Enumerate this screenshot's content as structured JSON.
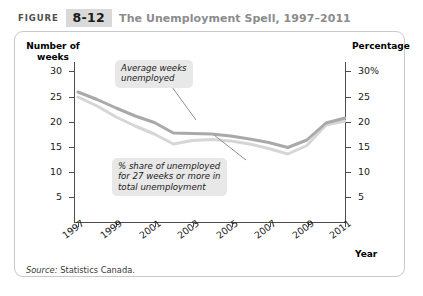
{
  "header": {
    "figure_word": "FIGURE",
    "figure_number": "8-12",
    "title": "The Unemployment Spell, 1997–2011"
  },
  "source": {
    "label": "Source:",
    "text": "Statistics Canada."
  },
  "colors": {
    "line_dark": "#a9a9a9",
    "line_light": "#d6d6d6",
    "axis": "#4d4d4d",
    "callout_bg": "#e8e8e8",
    "badge_bg": "#d9d9d9",
    "title_text": "#8c8c8c",
    "frame_border": "#c9c9c9"
  },
  "chart_data": {
    "type": "line",
    "title": "The Unemployment Spell, 1997–2011",
    "xlabel": "Year",
    "ylabel": "Number of weeks",
    "y2label": "Percentage",
    "xlim": [
      1997,
      2011
    ],
    "ylim": [
      0,
      32
    ],
    "y2lim": [
      0,
      32
    ],
    "grid": false,
    "legend": "annotations",
    "y_ticks": [
      5,
      10,
      15,
      20,
      25,
      30
    ],
    "y_tick_labels": [
      "5",
      "10",
      "15",
      "20",
      "25",
      "30"
    ],
    "y2_ticks": [
      5,
      10,
      15,
      20,
      25,
      30
    ],
    "y2_tick_labels": [
      "5",
      "10",
      "15",
      "20",
      "25",
      "30%"
    ],
    "x_ticks": [
      1997,
      1999,
      2001,
      2003,
      2005,
      2007,
      2009,
      2011
    ],
    "x_tick_labels": [
      "1997",
      "1999",
      "2001",
      "2003",
      "2005",
      "2007",
      "2009",
      "2011"
    ],
    "x": [
      1997,
      1998,
      1999,
      2000,
      2001,
      2002,
      2003,
      2004,
      2005,
      2006,
      2007,
      2008,
      2009,
      2010,
      2011
    ],
    "series": [
      {
        "name": "Average weeks unemployed",
        "axis": "left",
        "color": "#a9a9a9",
        "values": [
          26.0,
          24.5,
          22.8,
          21.2,
          19.9,
          17.8,
          17.7,
          17.6,
          17.2,
          16.6,
          15.9,
          14.9,
          16.4,
          19.8,
          20.8
        ]
      },
      {
        "name": "% share of unemployed for 27 weeks or more in total unemployment",
        "axis": "right",
        "color": "#d6d6d6",
        "values": [
          25.0,
          23.2,
          21.0,
          19.2,
          17.6,
          15.6,
          16.3,
          16.5,
          16.2,
          15.6,
          14.7,
          13.6,
          15.3,
          19.4,
          20.2
        ]
      }
    ],
    "annotations": [
      {
        "id": "callout-average-weeks",
        "text": "Average weeks\nunemployed",
        "target_x": 2003,
        "target_y": 17.7
      },
      {
        "id": "callout-share-27-weeks",
        "text": "% share of unemployed\nfor 27 weeks or more in\ntotal unemployment",
        "target_x": 2005,
        "target_y": 16.2
      }
    ]
  }
}
